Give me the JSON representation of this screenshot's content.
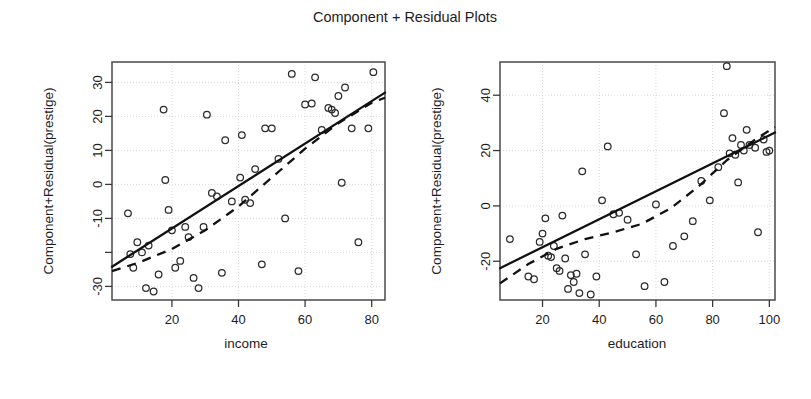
{
  "title": "Component + Residual Plots",
  "chart_data": [
    {
      "type": "scatter",
      "title": "Component + Residual Plots",
      "panel": "left",
      "xlabel": "income",
      "ylabel": "Component+Residual(prestige)",
      "xlim": [
        2,
        84
      ],
      "ylim": [
        -34,
        36
      ],
      "xticks": [
        20,
        40,
        60,
        80
      ],
      "xtick_labels": [
        "20",
        "40",
        "60",
        "80"
      ],
      "yticks": [
        -30,
        -20,
        -10,
        0,
        10,
        20,
        30
      ],
      "ytick_labels": [
        "-30",
        "",
        "-10",
        "0",
        "10",
        "20",
        "30"
      ],
      "grid": true,
      "legend": "none",
      "points": [
        [
          6.8,
          -8.5
        ],
        [
          7.5,
          -20.5
        ],
        [
          8.4,
          -24.5
        ],
        [
          9.6,
          -17.0
        ],
        [
          11.0,
          -20.0
        ],
        [
          12.2,
          -30.5
        ],
        [
          13.0,
          -18.0
        ],
        [
          14.5,
          -31.5
        ],
        [
          16.0,
          -26.5
        ],
        [
          17.5,
          22.0
        ],
        [
          18.0,
          1.3
        ],
        [
          19.0,
          -7.5
        ],
        [
          20.0,
          -13.5
        ],
        [
          21.0,
          -24.5
        ],
        [
          22.5,
          -22.5
        ],
        [
          24.0,
          -12.5
        ],
        [
          25.0,
          -15.5
        ],
        [
          26.5,
          -27.5
        ],
        [
          28.0,
          -30.5
        ],
        [
          29.5,
          -12.5
        ],
        [
          30.5,
          20.5
        ],
        [
          32.0,
          -2.5
        ],
        [
          33.5,
          -3.5
        ],
        [
          35.0,
          -26.0
        ],
        [
          36.0,
          13.0
        ],
        [
          38.0,
          -5.0
        ],
        [
          40.5,
          2.0
        ],
        [
          41.0,
          14.5
        ],
        [
          42.0,
          -4.5
        ],
        [
          43.5,
          -5.5
        ],
        [
          45.0,
          4.5
        ],
        [
          47.0,
          -23.5
        ],
        [
          48.0,
          16.5
        ],
        [
          50.0,
          16.5
        ],
        [
          52.0,
          7.5
        ],
        [
          54.0,
          -10.0
        ],
        [
          56.0,
          32.5
        ],
        [
          58.0,
          -25.5
        ],
        [
          60.0,
          23.5
        ],
        [
          62.0,
          23.8
        ],
        [
          63.0,
          31.5
        ],
        [
          65.0,
          16.0
        ],
        [
          67.0,
          22.5
        ],
        [
          68.0,
          22.0
        ],
        [
          69.0,
          21.0
        ],
        [
          70.0,
          26.0
        ],
        [
          71.0,
          0.5
        ],
        [
          72.0,
          28.5
        ],
        [
          74.0,
          16.5
        ],
        [
          76.0,
          -17.0
        ],
        [
          79.0,
          16.5
        ],
        [
          80.5,
          33.0
        ]
      ],
      "linear_fit": {
        "x": [
          2,
          84
        ],
        "y": [
          -24.2,
          27.0
        ]
      },
      "loess_fit": {
        "x": [
          2,
          10,
          20,
          30,
          40,
          50,
          60,
          70,
          80,
          84
        ],
        "y": [
          -25.5,
          -23.0,
          -19.0,
          -13.5,
          -6.5,
          2.0,
          10.5,
          18.0,
          24.0,
          25.5
        ]
      }
    },
    {
      "type": "scatter",
      "title": "Component + Residual Plots",
      "panel": "right",
      "xlabel": "education",
      "ylabel": "Component+Residual(prestige)",
      "xlim": [
        5,
        102
      ],
      "ylim": [
        -34,
        52
      ],
      "xticks": [
        20,
        40,
        60,
        80,
        100
      ],
      "xtick_labels": [
        "20",
        "40",
        "60",
        "80",
        "100"
      ],
      "yticks": [
        -20,
        0,
        20,
        40
      ],
      "ytick_labels": [
        "-20",
        "0",
        "20",
        "40"
      ],
      "grid": true,
      "legend": "none",
      "points": [
        [
          8.5,
          -12.0
        ],
        [
          15.0,
          -25.5
        ],
        [
          17.0,
          -26.5
        ],
        [
          19.0,
          -13.0
        ],
        [
          20.0,
          -10.0
        ],
        [
          21.0,
          -4.5
        ],
        [
          22.0,
          -18.0
        ],
        [
          23.0,
          -18.5
        ],
        [
          24.0,
          -14.5
        ],
        [
          25.0,
          -22.5
        ],
        [
          26.0,
          -23.5
        ],
        [
          27.0,
          -3.5
        ],
        [
          28.0,
          -19.0
        ],
        [
          29.0,
          -30.0
        ],
        [
          30.0,
          -25.0
        ],
        [
          31.0,
          -27.5
        ],
        [
          32.0,
          -24.5
        ],
        [
          33.0,
          -31.5
        ],
        [
          34.0,
          12.5
        ],
        [
          35.0,
          -17.5
        ],
        [
          37.0,
          -32.0
        ],
        [
          39.0,
          -25.5
        ],
        [
          41.0,
          2.0
        ],
        [
          43.0,
          21.5
        ],
        [
          45.0,
          -3.0
        ],
        [
          47.0,
          -2.5
        ],
        [
          50.0,
          -5.0
        ],
        [
          53.0,
          -17.5
        ],
        [
          56.0,
          -29.0
        ],
        [
          60.0,
          0.5
        ],
        [
          63.0,
          -27.5
        ],
        [
          66.0,
          -14.5
        ],
        [
          70.0,
          -11.0
        ],
        [
          73.0,
          -5.5
        ],
        [
          76.0,
          9.0
        ],
        [
          79.0,
          2.0
        ],
        [
          82.0,
          14.0
        ],
        [
          84.0,
          33.5
        ],
        [
          85.0,
          50.5
        ],
        [
          86.0,
          19.0
        ],
        [
          87.0,
          24.5
        ],
        [
          88.0,
          18.5
        ],
        [
          89.0,
          8.5
        ],
        [
          90.0,
          22.0
        ],
        [
          91.0,
          20.0
        ],
        [
          92.0,
          27.5
        ],
        [
          93.0,
          22.0
        ],
        [
          95.0,
          21.0
        ],
        [
          96.0,
          -9.5
        ],
        [
          98.0,
          24.0
        ],
        [
          99.0,
          19.5
        ],
        [
          100.0,
          20.0
        ]
      ],
      "linear_fit": {
        "x": [
          5,
          102
        ],
        "y": [
          -22.5,
          26.5
        ]
      },
      "loess_fit": {
        "x": [
          5,
          15,
          25,
          35,
          45,
          55,
          65,
          75,
          85,
          95,
          102
        ],
        "y": [
          -28.0,
          -21.0,
          -15.5,
          -12.0,
          -9.5,
          -6.5,
          -1.0,
          7.0,
          16.5,
          24.0,
          28.5
        ]
      }
    }
  ]
}
